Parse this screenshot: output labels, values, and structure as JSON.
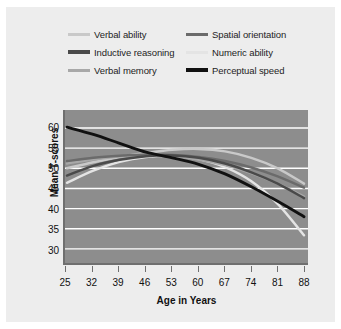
{
  "figure": {
    "background_color": "#ededed",
    "plot_background_color": "#8d8d8d",
    "gridline_color": "#ffffff"
  },
  "legend": {
    "position": "top",
    "columns": 2,
    "entries": [
      {
        "label": "Verbal ability",
        "color": "#c9c9c9",
        "column": 0,
        "row": 0
      },
      {
        "label": "Inductive reasoning",
        "color": "#4a4a4a",
        "column": 0,
        "row": 1
      },
      {
        "label": "Verbal memory",
        "color": "#a8a8a8",
        "column": 0,
        "row": 2
      },
      {
        "label": "Spatial orientation",
        "color": "#6b6b6b",
        "column": 1,
        "row": 0
      },
      {
        "label": "Numeric ability",
        "color": "#e4e4e4",
        "column": 1,
        "row": 1
      },
      {
        "label": "Perceptual speed",
        "color": "#111111",
        "column": 1,
        "row": 2
      }
    ]
  },
  "chart_data": {
    "type": "line",
    "title": "",
    "xlabel": "Age in Years",
    "ylabel": "Mean T-scores",
    "x": [
      25,
      32,
      39,
      46,
      53,
      60,
      67,
      74,
      81,
      88
    ],
    "xtick_labels": [
      "25",
      "32",
      "39",
      "46",
      "53",
      "60",
      "67",
      "74",
      "81",
      "88"
    ],
    "ytick_labels": [
      "60",
      "55",
      "50",
      "45",
      "40",
      "35",
      "30"
    ],
    "yticks": [
      60,
      55,
      50,
      45,
      40,
      35,
      30
    ],
    "xlim": [
      25,
      88
    ],
    "ylim": [
      27,
      62.5
    ],
    "grid": "horizontal",
    "legend_position": "top",
    "series": [
      {
        "name": "Verbal ability",
        "color": "#c9c9c9",
        "values": [
          50.0,
          51.5,
          52.8,
          53.8,
          54.6,
          54.8,
          54.2,
          52.6,
          50.0,
          46.2
        ]
      },
      {
        "name": "Inductive reasoning",
        "color": "#4a4a4a",
        "values": [
          48.2,
          50.6,
          52.1,
          53.0,
          53.2,
          52.6,
          51.2,
          49.0,
          46.2,
          42.6
        ]
      },
      {
        "name": "Verbal memory",
        "color": "#a8a8a8",
        "values": [
          51.2,
          52.2,
          52.9,
          53.2,
          53.0,
          52.2,
          50.8,
          48.8,
          46.2,
          43.0
        ]
      },
      {
        "name": "Spatial orientation",
        "color": "#6b6b6b",
        "values": [
          51.8,
          52.6,
          53.1,
          53.4,
          53.3,
          52.8,
          51.8,
          50.2,
          48.0,
          45.2
        ]
      },
      {
        "name": "Numeric ability",
        "color": "#e4e4e4",
        "values": [
          46.4,
          49.4,
          51.6,
          52.8,
          53.1,
          52.3,
          50.3,
          46.8,
          41.2,
          33.4
        ]
      },
      {
        "name": "Perceptual speed",
        "color": "#111111",
        "values": [
          60.2,
          58.4,
          56.2,
          54.0,
          52.6,
          51.0,
          48.6,
          45.4,
          41.8,
          38.0
        ]
      }
    ]
  }
}
